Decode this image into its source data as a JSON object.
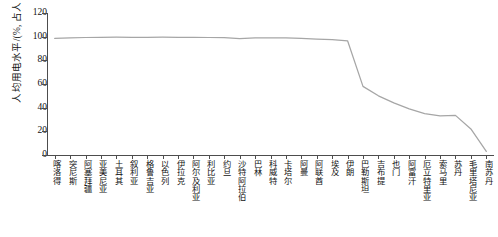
{
  "chart_data": {
    "type": "line",
    "title": "",
    "xlabel": "",
    "ylabel": "人均用电水平/(%, 占人口比重)",
    "ylim": [
      0,
      120
    ],
    "yticks": [
      0,
      20,
      40,
      60,
      80,
      100,
      120
    ],
    "grid": false,
    "legend": false,
    "line_color": "#a6a6a6",
    "categories": [
      "喀洛得",
      "突尼斯",
      "阿塞拜疆",
      "亚美尼亚",
      "土耳其",
      "叙利亚",
      "格鲁吉亚",
      "以色列",
      "伊拉克",
      "阿尔及利亚",
      "利比亚",
      "约旦",
      "沙特阿拉伯",
      "巴林",
      "科威特",
      "卡塔尔",
      "阿曼",
      "阿联酋",
      "埃及",
      "伊朗",
      "巴勒斯坦",
      "吉布提",
      "也门",
      "阿富汗",
      "厄立特里亚",
      "索马里",
      "苏丹",
      "毛里塔尼亚",
      "南苏丹"
    ],
    "values": [
      98.5,
      99.0,
      99.3,
      99.5,
      99.6,
      99.5,
      99.5,
      99.6,
      99.5,
      99.4,
      99.3,
      99.2,
      98.3,
      99.0,
      99.0,
      99.0,
      98.6,
      98.0,
      97.4,
      96.5,
      58.0,
      50.0,
      44.0,
      39.0,
      35.0,
      33.0,
      33.5,
      22.0,
      3.0
    ]
  },
  "axes": {
    "y_title": "人均用电水平/(%, 占人口比重)",
    "y_tick_labels": [
      "0",
      "20",
      "40",
      "60",
      "80",
      "100",
      "120"
    ]
  }
}
